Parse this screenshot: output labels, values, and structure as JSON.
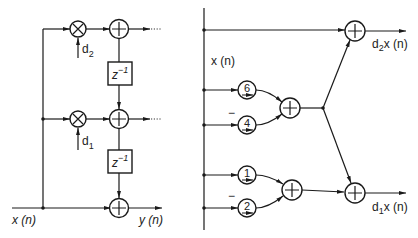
{
  "left_diagram": {
    "input_label": "x (n)",
    "output_label": "y (n)",
    "coefficients": [
      {
        "symbol": "d",
        "subscript": "2"
      },
      {
        "symbol": "d",
        "subscript": "1"
      }
    ],
    "delay_label": {
      "base": "z",
      "exponent": "−1"
    },
    "multiplier_icon": "times-circle",
    "adder_icon": "plus-circle"
  },
  "right_diagram": {
    "input_label": "x (n)",
    "upper_group": {
      "constants": [
        {
          "value": "6",
          "sign": ""
        },
        {
          "value": "4",
          "sign": "−"
        }
      ]
    },
    "lower_group": {
      "constants": [
        {
          "value": "1",
          "sign": ""
        },
        {
          "value": "2",
          "sign": "−"
        }
      ]
    },
    "outputs": [
      {
        "coef": "d",
        "subscript": "2",
        "rest": "x (n)"
      },
      {
        "coef": "d",
        "subscript": "1",
        "rest": "x (n)"
      }
    ],
    "adder_icon": "plus-circle"
  }
}
